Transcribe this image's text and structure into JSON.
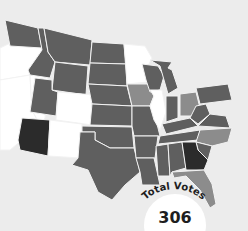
{
  "title": "Total Votes",
  "total_votes": "306",
  "legend_colors": {
    "won": "#5f5f5f",
    "flipped": "#2b2b2b",
    "leaning": "#8c8c8c",
    "lost": "#ffffff",
    "background": "#ececec"
  },
  "states": {
    "dark": [
      "WA",
      "ID",
      "MT",
      "WY",
      "UT",
      "ND",
      "SD",
      "NE",
      "KS",
      "OK",
      "TX",
      "MO",
      "AR",
      "LA",
      "MS",
      "AL",
      "TN",
      "KY",
      "IN",
      "MI",
      "WI",
      "PA",
      "WV",
      "SC",
      "VA"
    ],
    "medium": [
      "IA",
      "OH",
      "NC",
      "FL"
    ],
    "black": [
      "AZ",
      "GA"
    ],
    "white": [
      "OR",
      "CA",
      "NV",
      "CO",
      "NM",
      "MN",
      "IL"
    ]
  }
}
